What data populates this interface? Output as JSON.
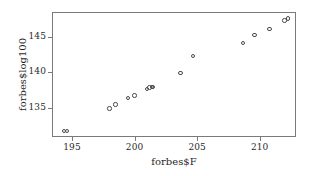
{
  "chart_data": {
    "type": "scatter",
    "title": "",
    "xlabel": "forbes$F",
    "ylabel": "forbes$log100",
    "xlim": [
      193.4,
      212.9
    ],
    "ylim": [
      130.8,
      148.6
    ],
    "xticks": [
      195,
      200,
      205,
      210
    ],
    "yticks": [
      135,
      140,
      145
    ],
    "xtick_labels": [
      "195",
      "200",
      "205",
      "210"
    ],
    "ytick_labels": [
      "135",
      "140",
      "145"
    ],
    "grid": false,
    "legend": false,
    "marker": "open-circle",
    "marker_color": "#4a4a4a",
    "n_points": 17,
    "x": [
      194.3,
      194.5,
      197.9,
      198.4,
      199.4,
      199.9,
      200.9,
      201.1,
      201.4,
      201.3,
      203.6,
      204.6,
      208.6,
      209.5,
      210.7,
      211.9,
      212.2
    ],
    "y": [
      131.79,
      131.79,
      135.02,
      135.55,
      136.46,
      136.83,
      137.82,
      138.0,
      138.06,
      138.05,
      140.04,
      142.44,
      145.47,
      144.34,
      146.3,
      147.54,
      147.8
    ],
    "points": [
      {
        "x": 194.3,
        "y": 131.79
      },
      {
        "x": 194.5,
        "y": 131.79
      },
      {
        "x": 197.9,
        "y": 135.02
      },
      {
        "x": 198.4,
        "y": 135.55
      },
      {
        "x": 199.4,
        "y": 136.46
      },
      {
        "x": 199.9,
        "y": 136.83
      },
      {
        "x": 200.9,
        "y": 137.82
      },
      {
        "x": 201.1,
        "y": 138.0
      },
      {
        "x": 201.4,
        "y": 138.06
      },
      {
        "x": 201.3,
        "y": 138.05
      },
      {
        "x": 203.6,
        "y": 140.04
      },
      {
        "x": 204.6,
        "y": 142.44
      },
      {
        "x": 208.6,
        "y": 144.34
      },
      {
        "x": 209.5,
        "y": 145.47
      },
      {
        "x": 210.7,
        "y": 146.3
      },
      {
        "x": 211.9,
        "y": 147.54
      },
      {
        "x": 212.2,
        "y": 147.8
      }
    ]
  },
  "axes": {
    "x_title": "forbes$F",
    "y_title": "forbes$log100"
  }
}
